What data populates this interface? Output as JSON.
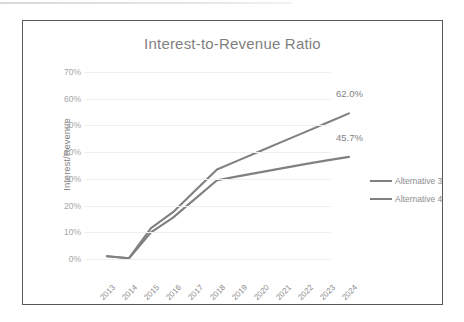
{
  "chart_data": {
    "type": "line",
    "title": "Interest-to-Revenue Ratio",
    "xlabel": "",
    "ylabel": "Interest/Revenue",
    "categories": [
      "2013",
      "2014",
      "2015",
      "2016",
      "2017",
      "2018",
      "2019",
      "2020",
      "2021",
      "2022",
      "2023",
      "2024"
    ],
    "ylim": [
      0,
      70
    ],
    "ytick_labels": [
      "0%",
      "10%",
      "20%",
      "30%",
      "40%",
      "50%",
      "60%",
      "70%"
    ],
    "ytick_values": [
      0,
      10,
      20,
      30,
      40,
      50,
      60,
      70
    ],
    "grid": true,
    "legend_position": "right",
    "series": [
      {
        "name": "Alternative 3",
        "color": "#808080",
        "values": [
          8.5,
          7.8,
          19.0,
          25.0,
          33.0,
          41.0,
          44.5,
          48.0,
          51.5,
          55.0,
          58.5,
          62.0
        ],
        "end_label": "62.0%"
      },
      {
        "name": "Alternative 4",
        "color": "#808080",
        "values": [
          8.5,
          7.8,
          17.5,
          23.0,
          30.0,
          37.0,
          38.5,
          40.0,
          41.5,
          43.0,
          44.4,
          45.7
        ],
        "end_label": "45.7%"
      }
    ],
    "annotations": [
      "62.0%",
      "45.7%"
    ]
  },
  "legend": {
    "items": [
      {
        "label": "Alternative 3"
      },
      {
        "label": "Alternative 4"
      }
    ]
  }
}
